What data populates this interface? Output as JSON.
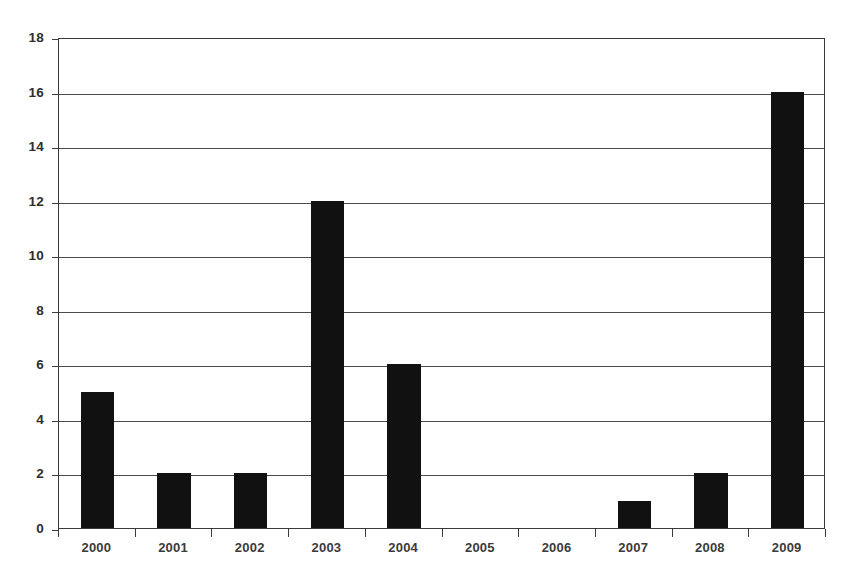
{
  "chart_data": {
    "type": "bar",
    "title": "",
    "subtitle": "",
    "xlabel": "",
    "ylabel": "",
    "categories": [
      "2000",
      "2001",
      "2002",
      "2003",
      "2004",
      "2005",
      "2006",
      "2007",
      "2008",
      "2009"
    ],
    "values": [
      5,
      2,
      2,
      12,
      6,
      0,
      0,
      1,
      2,
      16
    ],
    "series": [
      {
        "name": "",
        "values": [
          5,
          2,
          2,
          12,
          6,
          0,
          0,
          1,
          2,
          16
        ]
      }
    ],
    "ylim": [
      0,
      18
    ],
    "ytick_values": [
      0,
      2,
      4,
      6,
      8,
      10,
      12,
      14,
      16,
      18
    ],
    "ytick_labels": [
      "0",
      "2",
      "4",
      "6",
      "8",
      "10",
      "12",
      "14",
      "16",
      "18"
    ],
    "grid": true,
    "grid_axis": "y",
    "legend": false,
    "legend_position": "none",
    "annotations": [],
    "bar_color": "#111111",
    "axis_color": "#3a3a3a",
    "grid_color": "#4a4a4a",
    "background_color": "#ffffff",
    "plot_background_color": "#ffffff"
  }
}
